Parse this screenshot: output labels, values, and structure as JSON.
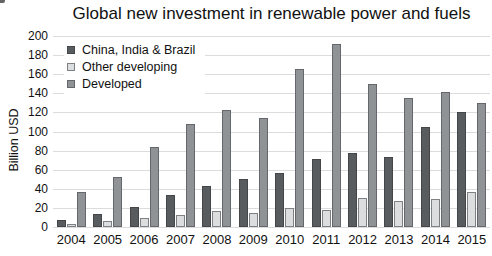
{
  "chart_data": {
    "type": "bar",
    "title": "Global new investment in renewable power and fuels",
    "ylabel": "Billion USD",
    "xlabel": "",
    "ylim": [
      0,
      200
    ],
    "yticks": [
      0,
      20,
      40,
      60,
      80,
      100,
      120,
      140,
      160,
      180,
      200
    ],
    "grid": true,
    "legend_position": "top-left-inside",
    "categories": [
      "2004",
      "2005",
      "2006",
      "2007",
      "2008",
      "2009",
      "2010",
      "2011",
      "2012",
      "2013",
      "2014",
      "2015"
    ],
    "series": [
      {
        "name": "China, India & Brazil",
        "color": "#585c5f",
        "border_color": "#43474a",
        "values": [
          7,
          14,
          21,
          34,
          43,
          50,
          57,
          71,
          77,
          73,
          105,
          120
        ]
      },
      {
        "name": "Other developing",
        "color": "#dcddde",
        "border_color": "#7d8184",
        "values": [
          3,
          6,
          9,
          13,
          17,
          15,
          20,
          18,
          30,
          27,
          29,
          37
        ]
      },
      {
        "name": "Developed",
        "color": "#8f9396",
        "border_color": "#64686c",
        "values": [
          37,
          52,
          84,
          108,
          122,
          114,
          165,
          192,
          150,
          135,
          141,
          130
        ]
      }
    ],
    "colors": {
      "background": "#ffffff",
      "grid": "#dcdcdc",
      "text": "#1a1a1a"
    }
  }
}
